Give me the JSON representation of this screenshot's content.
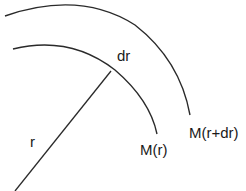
{
  "diagram": {
    "type": "concentric-shells",
    "colors": {
      "stroke": "#2a2a2a",
      "background": "#ffffff",
      "text": "#1a1a1a"
    },
    "labels": {
      "radius": "r",
      "shell_thickness": "dr",
      "inner_mass": "M(r)",
      "outer_mass": "M(r+dr)"
    },
    "elements": [
      {
        "kind": "arc",
        "name": "inner-shell-arc",
        "label": "M(r)"
      },
      {
        "kind": "arc",
        "name": "outer-shell-arc",
        "label": "M(r+dr)"
      },
      {
        "kind": "line",
        "name": "radius-line",
        "label": "r"
      }
    ]
  }
}
